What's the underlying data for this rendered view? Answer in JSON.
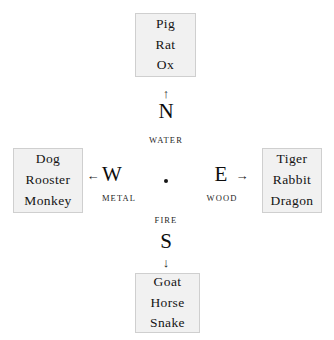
{
  "diagram": {
    "center": {
      "marker": "center-dot"
    },
    "colors": {
      "background": "#ffffff",
      "box_fill": "#f1f1f1",
      "box_border": "#cfcfcf",
      "text": "#141414"
    },
    "quadrants": {
      "north": {
        "direction_letter": "N",
        "arrow_glyph": "↑",
        "arrow_name": "arrow-up-icon",
        "element": "WATER",
        "animals": [
          "Pig",
          "Rat",
          "Ox"
        ]
      },
      "south": {
        "direction_letter": "S",
        "arrow_glyph": "↓",
        "arrow_name": "arrow-down-icon",
        "element": "FIRE",
        "animals": [
          "Goat",
          "Horse",
          "Snake"
        ]
      },
      "west": {
        "direction_letter": "W",
        "arrow_glyph": "←",
        "arrow_name": "arrow-left-icon",
        "element": "METAL",
        "animals": [
          "Dog",
          "Rooster",
          "Monkey"
        ]
      },
      "east": {
        "direction_letter": "E",
        "arrow_glyph": "→",
        "arrow_name": "arrow-right-icon",
        "element": "WOOD",
        "animals": [
          "Tiger",
          "Rabbit",
          "Dragon"
        ]
      }
    }
  }
}
